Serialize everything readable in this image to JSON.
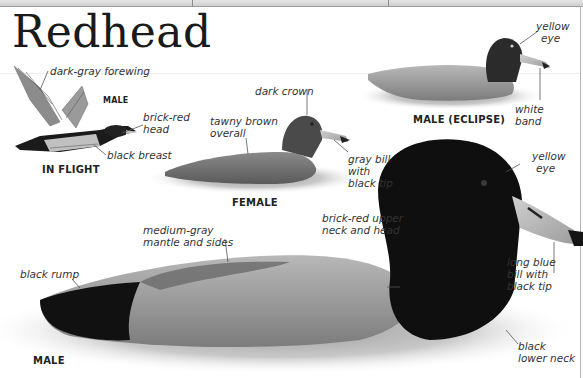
{
  "page": {
    "title": "Redhead",
    "accent_colors": {
      "text": "#1a1a1a",
      "label": "#333333",
      "leader_line": "#555555"
    }
  },
  "figures": {
    "in_flight": {
      "caption": "IN FLIGHT",
      "sub_caption": "MALE",
      "labels": {
        "forewing": "dark-gray forewing",
        "head_line1": "brick-red",
        "head_line2": "head",
        "breast": "black breast"
      }
    },
    "female": {
      "caption": "FEMALE",
      "labels": {
        "crown": "dark crown",
        "overall_line1": "tawny brown",
        "overall_line2": "overall",
        "bill_line1": "gray bill",
        "bill_line2": "with",
        "bill_line3": "black tip"
      }
    },
    "male_eclipse": {
      "caption": "MALE (ECLIPSE)",
      "labels": {
        "eye_line1": "yellow",
        "eye_line2": "eye",
        "band_line1": "white",
        "band_line2": "band"
      }
    },
    "male": {
      "caption": "MALE",
      "labels": {
        "mantle_line1": "medium-gray",
        "mantle_line2": "mantle and sides",
        "rump": "black rump",
        "upper_neck_line1": "brick-red upper",
        "upper_neck_line2": "neck and head",
        "eye_line1": "yellow",
        "eye_line2": "eye",
        "bill_line1": "long blue",
        "bill_line2": "bill with",
        "bill_line3": "black tip",
        "lower_neck_line1": "black",
        "lower_neck_line2": "lower neck"
      }
    }
  }
}
